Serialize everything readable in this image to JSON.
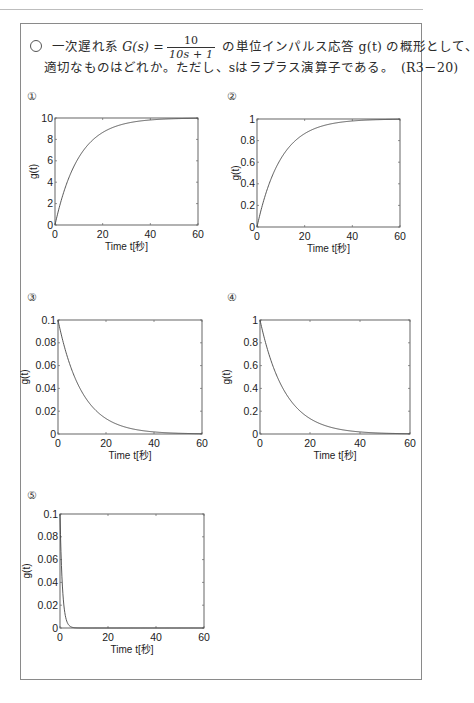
{
  "header": {
    "rule": true
  },
  "question": {
    "marker": "○",
    "line1_pre": "一次遅れ系 ",
    "tf_label": "G(s) =",
    "tf_numerator": "10",
    "tf_denominator": "10s + 1",
    "line1_post": " の単位インパルス応答 g(t) の概形として、",
    "line2": "適切なものはどれか。ただし、sはラプラス演算子である。　(R3－20)"
  },
  "options": [
    {
      "label": "①",
      "ylabel": "g(t)",
      "xlabel": "Time t[秒]"
    },
    {
      "label": "②",
      "ylabel": "g(t)",
      "xlabel": "Time t[秒]"
    },
    {
      "label": "③",
      "ylabel": "g(t)",
      "xlabel": "Time t[秒]"
    },
    {
      "label": "④",
      "ylabel": "g(t)",
      "xlabel": "Time t[秒]"
    },
    {
      "label": "⑤",
      "ylabel": "g(t)",
      "xlabel": "Time t[秒]"
    }
  ],
  "chart_data": [
    {
      "type": "line",
      "title": "①",
      "xlabel": "Time t[秒]",
      "ylabel": "g(t)",
      "xlim": [
        0,
        60
      ],
      "ylim": [
        0,
        10
      ],
      "xticks": [
        0,
        20,
        40,
        60
      ],
      "yticks": [
        0,
        2,
        4,
        6,
        8,
        10
      ],
      "function": "10*(1-exp(-t/10))",
      "x": [
        0,
        5,
        10,
        20,
        30,
        40,
        50,
        60
      ],
      "values": [
        0,
        3.93,
        6.32,
        8.65,
        9.5,
        9.82,
        9.93,
        9.98
      ],
      "grid": false
    },
    {
      "type": "line",
      "title": "②",
      "xlabel": "Time t[秒]",
      "ylabel": "g(t)",
      "xlim": [
        0,
        60
      ],
      "ylim": [
        0,
        1
      ],
      "xticks": [
        0,
        20,
        40,
        60
      ],
      "yticks": [
        0,
        0.2,
        0.4,
        0.6,
        0.8,
        1
      ],
      "function": "1-exp(-t/10)",
      "x": [
        0,
        5,
        10,
        20,
        30,
        40,
        50,
        60
      ],
      "values": [
        0,
        0.393,
        0.632,
        0.865,
        0.95,
        0.982,
        0.993,
        0.998
      ],
      "grid": false
    },
    {
      "type": "line",
      "title": "③",
      "xlabel": "Time t[秒]",
      "ylabel": "g(t)",
      "xlim": [
        0,
        60
      ],
      "ylim": [
        0,
        0.1
      ],
      "xticks": [
        0,
        20,
        40,
        60
      ],
      "yticks": [
        0,
        0.02,
        0.04,
        0.06,
        0.08,
        0.1
      ],
      "function": "0.1*exp(-t/10)",
      "x": [
        0,
        5,
        10,
        20,
        30,
        40,
        50,
        60
      ],
      "values": [
        0.1,
        0.0607,
        0.0368,
        0.0135,
        0.005,
        0.0018,
        0.0007,
        0.0002
      ],
      "grid": false
    },
    {
      "type": "line",
      "title": "④",
      "xlabel": "Time t[秒]",
      "ylabel": "g(t)",
      "xlim": [
        0,
        60
      ],
      "ylim": [
        0,
        1
      ],
      "xticks": [
        0,
        20,
        40,
        60
      ],
      "yticks": [
        0,
        0.2,
        0.4,
        0.6,
        0.8,
        1
      ],
      "function": "exp(-t/10)",
      "x": [
        0,
        5,
        10,
        20,
        30,
        40,
        50,
        60
      ],
      "values": [
        1,
        0.607,
        0.368,
        0.135,
        0.05,
        0.018,
        0.007,
        0.002
      ],
      "grid": false
    },
    {
      "type": "line",
      "title": "⑤",
      "xlabel": "Time t[秒]",
      "ylabel": "g(t)",
      "xlim": [
        0,
        60
      ],
      "ylim": [
        0,
        0.1
      ],
      "xticks": [
        0,
        20,
        40,
        60
      ],
      "yticks": [
        0,
        0.02,
        0.04,
        0.06,
        0.08,
        0.1
      ],
      "function": "0.1*exp(-t)",
      "x": [
        0,
        1,
        2,
        3,
        5,
        10,
        60
      ],
      "values": [
        0.1,
        0.0368,
        0.0135,
        0.005,
        0.0007,
        0.0,
        0.0
      ],
      "grid": false
    }
  ]
}
